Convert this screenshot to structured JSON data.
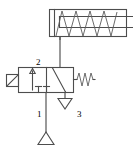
{
  "diagram": {
    "type": "fluid-power-schematic",
    "background_color": "#ffffff",
    "line_color": "#4d4d4d",
    "label_color": "#6b6b6b"
  },
  "components": {
    "cylinder": {
      "name": "single-acting-spring-return-cylinder",
      "barrel": {
        "x": 49,
        "y": 9,
        "width": 78,
        "height": 28
      },
      "piston_face_x": 60,
      "rod": {
        "from_x": 60,
        "to_x": 133,
        "y": 23
      },
      "spring_zigzag_peaks": 4,
      "port_x": 60,
      "port_y": 37
    },
    "valve": {
      "name": "three-two-way-valve",
      "positions": 2,
      "ports": 3,
      "body": {
        "x": 18,
        "y": 67,
        "width": 56,
        "height": 26
      },
      "divider_x": 46,
      "left_box_symbol": "flow-arrow-up",
      "right_box_symbol": "diagonal-blocked-crossover",
      "actuator_left": {
        "type": "lever-actuator",
        "x": 6,
        "y": 74,
        "width": 13,
        "height": 13
      },
      "actuator_right": {
        "type": "spring-return",
        "x": 74,
        "y": 74,
        "zigzag_peaks": 3
      }
    },
    "supply": {
      "name": "pressure-source",
      "triangle_apex_x": 46,
      "triangle_y_top": 132,
      "triangle_half_width": 8,
      "triangle_height": 12
    },
    "exhaust": {
      "name": "exhaust-port-triangle",
      "apex_x": 65,
      "y_top": 98,
      "half_width": 7,
      "height": 11
    }
  },
  "lines": {
    "cylinder_to_valve": {
      "x": 60,
      "y1": 37,
      "y2": 67
    },
    "supply_to_valve": {
      "x": 46,
      "y1": 93,
      "y2": 132
    }
  },
  "labels": {
    "port_2": {
      "text": "2",
      "x": 39,
      "y": 60
    },
    "port_1": {
      "text": "1",
      "x": 40,
      "y": 110
    },
    "port_3": {
      "text": "3",
      "x": 80,
      "y": 110
    }
  }
}
